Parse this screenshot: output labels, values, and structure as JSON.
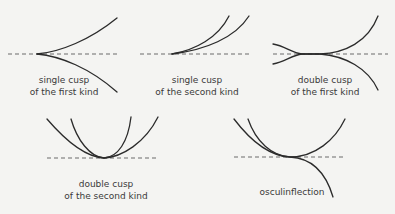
{
  "panels": [
    {
      "id": "single-cusp-first-kind",
      "label_line1": "single cusp",
      "label_line2": "of the first kind"
    },
    {
      "id": "single-cusp-second-kind",
      "label_line1": "single cusp",
      "label_line2": "of the second kind"
    },
    {
      "id": "double-cusp-first-kind",
      "label_line1": "double cusp",
      "label_line2": "of the first kind"
    },
    {
      "id": "double-cusp-second-kind",
      "label_line1": "double cusp",
      "label_line2": "of the second kind"
    },
    {
      "id": "osculinflection",
      "label_line1": "osculinflection"
    }
  ],
  "colors": {
    "curve": "#2b2b2b",
    "tangent": "#6a6a6a",
    "background": "#f4f4f2",
    "text": "#3a3a3a"
  }
}
